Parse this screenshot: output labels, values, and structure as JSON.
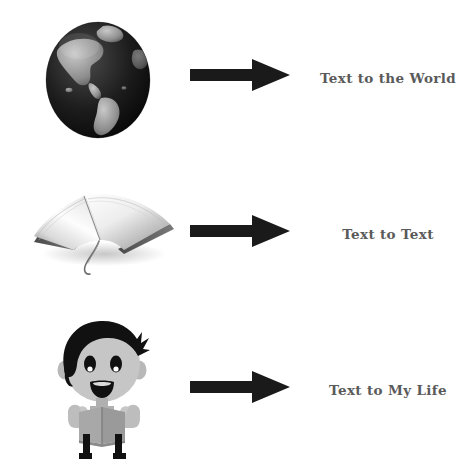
{
  "diagram": {
    "background_color": "#ffffff",
    "label_color": "#5a5a5a",
    "arrow_color": "#1a1a1a",
    "rows": [
      {
        "id": "text-to-world",
        "icon": "globe-icon",
        "icon_description": "Earth globe showing the Americas",
        "arrow": "right-arrow-icon",
        "label": "Text to the World"
      },
      {
        "id": "text-to-text",
        "icon": "open-book-icon",
        "icon_description": "Open book with ribbon bookmark",
        "arrow": "right-arrow-icon",
        "label": "Text to Text"
      },
      {
        "id": "text-to-my-life",
        "icon": "reading-boy-icon",
        "icon_description": "Cartoon boy with black hair reading a book",
        "arrow": "right-arrow-icon",
        "label": "Text to My Life"
      }
    ]
  }
}
